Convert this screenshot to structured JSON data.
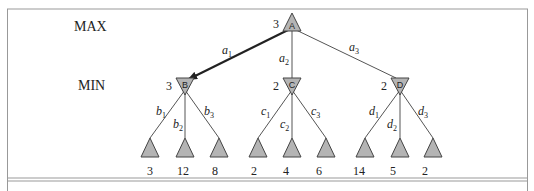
{
  "levels": {
    "max_label": "MAX",
    "min_label": "MIN"
  },
  "colors": {
    "node_fill": "#b4b4b4",
    "node_stroke": "#444444",
    "edge": "#555555",
    "best_edge": "#222222",
    "frame": "#999999"
  },
  "root": {
    "id": "A",
    "label": "A",
    "value": "3"
  },
  "root_edges": [
    {
      "name": "a",
      "sub": "1",
      "target": "B",
      "highlighted": true
    },
    {
      "name": "a",
      "sub": "2",
      "target": "C",
      "highlighted": false
    },
    {
      "name": "a",
      "sub": "3",
      "target": "D",
      "highlighted": false
    }
  ],
  "min_nodes": [
    {
      "id": "B",
      "label": "B",
      "value": "3",
      "edges": [
        {
          "name": "b",
          "sub": "1"
        },
        {
          "name": "b",
          "sub": "2"
        },
        {
          "name": "b",
          "sub": "3"
        }
      ],
      "leaves": [
        "3",
        "12",
        "8"
      ]
    },
    {
      "id": "C",
      "label": "C",
      "value": "2",
      "edges": [
        {
          "name": "c",
          "sub": "1"
        },
        {
          "name": "c",
          "sub": "2"
        },
        {
          "name": "c",
          "sub": "3"
        }
      ],
      "leaves": [
        "2",
        "4",
        "6"
      ]
    },
    {
      "id": "D",
      "label": "D",
      "value": "2",
      "edges": [
        {
          "name": "d",
          "sub": "1"
        },
        {
          "name": "d",
          "sub": "2"
        },
        {
          "name": "d",
          "sub": "3"
        }
      ],
      "leaves": [
        "14",
        "5",
        "2"
      ]
    }
  ]
}
